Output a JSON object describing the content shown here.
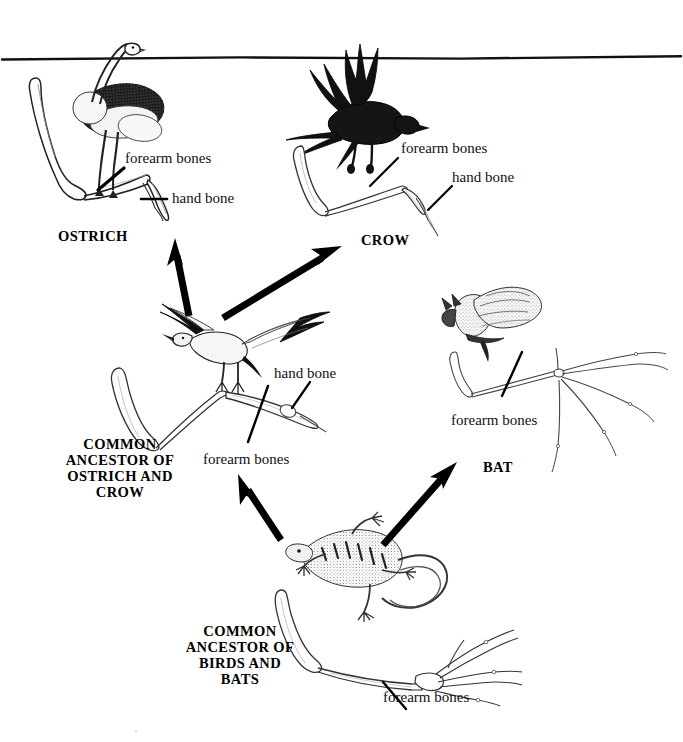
{
  "figure": {
    "type": "evolutionary-tree-diagram",
    "background_color": "#ffffff",
    "ink_color": "#000000"
  },
  "top_rule": {
    "name": "horizontal-divider-line",
    "present": true
  },
  "nodes": [
    {
      "id": "ostrich",
      "label": "OSTRICH",
      "kind": "extant-taxon",
      "organism_illustration": "ostrich-drawing",
      "skeleton_illustration": "ostrich-wing-skeleton",
      "annotations": [
        {
          "text": "forearm bones",
          "leader": "diagonal-leader-line"
        },
        {
          "text": "hand bone",
          "leader": "horizontal-leader-line"
        }
      ]
    },
    {
      "id": "crow",
      "label": "CROW",
      "kind": "extant-taxon",
      "organism_illustration": "crow-drawing",
      "skeleton_illustration": "crow-wing-skeleton",
      "annotations": [
        {
          "text": "forearm bones",
          "leader": "diagonal-leader-line"
        },
        {
          "text": "hand bone",
          "leader": "diagonal-leader-line"
        }
      ]
    },
    {
      "id": "bat",
      "label": "BAT",
      "kind": "extant-taxon",
      "organism_illustration": "bat-drawing",
      "skeleton_illustration": "bat-wing-skeleton",
      "annotations": [
        {
          "text": "forearm bones",
          "leader": "diagonal-leader-line"
        }
      ]
    },
    {
      "id": "ancestor_birds",
      "label": "COMMON\nANCESTOR OF\nOSTRICH AND\nCROW",
      "label_lines": [
        "COMMON",
        "ANCESTOR OF",
        "OSTRICH AND",
        "CROW"
      ],
      "kind": "common-ancestor",
      "organism_illustration": "archaeopteryx-drawing",
      "skeleton_illustration": "archaeopteryx-wing-skeleton",
      "annotations": [
        {
          "text": "hand bone",
          "leader": "diagonal-leader-line"
        },
        {
          "text": "forearm bones",
          "leader": "diagonal-leader-line"
        }
      ]
    },
    {
      "id": "ancestor_root",
      "label": "COMMON\nANCESTOR OF\nBIRDS AND\nBATS",
      "label_lines": [
        "COMMON",
        "ANCESTOR OF",
        "BIRDS AND",
        "BATS"
      ],
      "kind": "common-ancestor",
      "organism_illustration": "lizard-drawing",
      "skeleton_illustration": "lizard-forelimb-skeleton",
      "annotations": [
        {
          "text": "forearm bones",
          "leader": "diagonal-leader-line"
        }
      ]
    }
  ],
  "arrows": [
    {
      "id": "a1",
      "from": "ancestor_birds",
      "to": "ostrich",
      "direction": "up"
    },
    {
      "id": "a2",
      "from": "ancestor_birds",
      "to": "crow",
      "direction": "up-right"
    },
    {
      "id": "a3",
      "from": "ancestor_root",
      "to": "ancestor_birds",
      "direction": "up-left"
    },
    {
      "id": "a4",
      "from": "ancestor_root",
      "to": "bat",
      "direction": "up-right"
    }
  ],
  "labels": {
    "ostrich_forearm": "forearm bones",
    "ostrich_hand": "hand bone",
    "ostrich_name": "OSTRICH",
    "crow_forearm": "forearm bones",
    "crow_hand": "hand bone",
    "crow_name": "CROW",
    "mid_hand": "hand bone",
    "mid_forearm": "forearm bones",
    "mid_name_l1": "COMMON",
    "mid_name_l2": "ANCESTOR OF",
    "mid_name_l3": "OSTRICH AND",
    "mid_name_l4": "CROW",
    "bat_forearm": "forearm bones",
    "bat_name": "BAT",
    "root_name_l1": "COMMON",
    "root_name_l2": "ANCESTOR OF",
    "root_name_l3": "BIRDS AND",
    "root_name_l4": "BATS",
    "root_forearm": "forearm bones"
  }
}
